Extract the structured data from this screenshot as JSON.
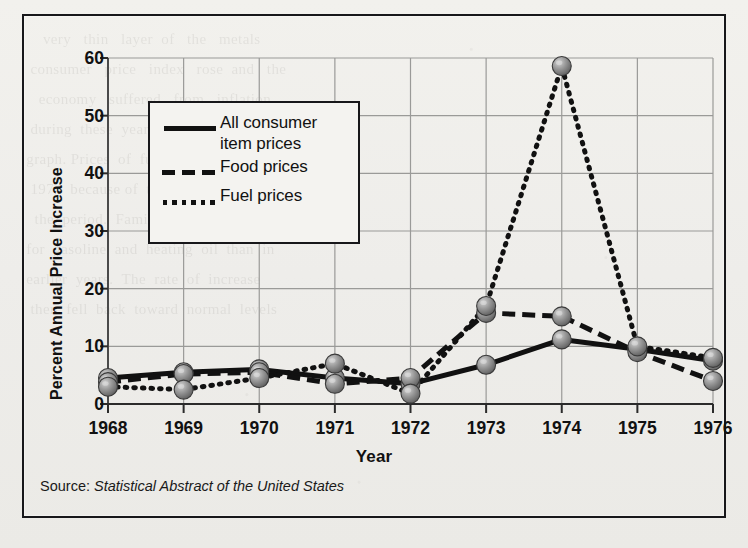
{
  "figure": {
    "ylabel": "Percent Annual Price Increase",
    "xlabel": "Year",
    "source_prefix": "Source: ",
    "source_title": "Statistical Abstract of the United States"
  },
  "legend": {
    "entries": [
      {
        "label_line1": "All consumer",
        "label_line2": "item prices",
        "style": "solid",
        "key": "legend-key-solid"
      },
      {
        "label_line1": "Food prices",
        "label_line2": "",
        "style": "dashed",
        "key": "legend-key-dashed"
      },
      {
        "label_line1": "Fuel prices",
        "label_line2": "",
        "style": "dotted",
        "key": "legend-key-dotted"
      }
    ]
  },
  "colors": {
    "ink": "#111111",
    "paper": "#efeeea",
    "grid": "#9a9a98",
    "marker_fill": "#8c8c8c",
    "marker_edge": "#3a3a3a",
    "frame": "#17171a"
  },
  "chart_data": {
    "type": "line",
    "title": "",
    "xlabel": "Year",
    "ylabel": "Percent Annual Price Increase",
    "x": [
      1968,
      1969,
      1970,
      1971,
      1972,
      1973,
      1974,
      1975,
      1976
    ],
    "categories": [
      "1968",
      "1969",
      "1970",
      "1971",
      "1972",
      "1973",
      "1974",
      "1975",
      "1976"
    ],
    "xlim": [
      1968,
      1976
    ],
    "ylim": [
      0,
      60
    ],
    "yticks": [
      0,
      10,
      20,
      30,
      40,
      50,
      60
    ],
    "ytick_labels": [
      "0",
      "10",
      "20",
      "30",
      "40",
      "50",
      "60"
    ],
    "grid": true,
    "legend_position": "upper-left-inset",
    "series": [
      {
        "name": "All consumer item prices",
        "style": "solid",
        "values": [
          4.5,
          5.5,
          6.0,
          4.5,
          3.5,
          6.8,
          11.2,
          9.5,
          7.5
        ]
      },
      {
        "name": "Food prices",
        "style": "dashed",
        "values": [
          3.8,
          5.2,
          5.5,
          3.5,
          4.5,
          15.8,
          15.2,
          9.0,
          4.0
        ]
      },
      {
        "name": "Fuel prices",
        "style": "dotted",
        "values": [
          3.0,
          2.5,
          4.5,
          7.0,
          1.8,
          17.0,
          58.6,
          10.0,
          8.0
        ]
      }
    ],
    "source": "Statistical Abstract of the United States"
  },
  "bleedthrough": "      very   thin   layer  of   the   metals\n   consumer   price   index   rose  and   the\n     economy   suffered   from   inflation\n   during  these  years, as  shown  in  the\n  graph. Prices  of  fuel  rose  sharply  in\n   1974  because of  the  oil  embargo  of\n    the  period.  Families  paid  far  more\n  for  gasoline  and  heating  oil  than  in\n  earlier  years.  The  rate  of  increase\n   then  fell  back  toward  normal  levels"
}
